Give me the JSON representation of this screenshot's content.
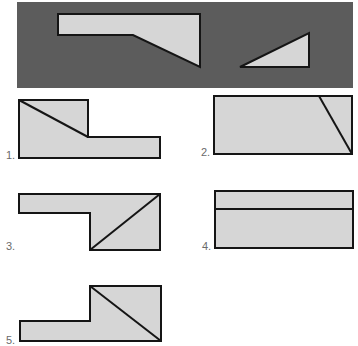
{
  "colors": {
    "panel": "#5c5c5c",
    "fill": "#d6d6d6",
    "stroke": "#151515",
    "label": "#6a6a6a"
  },
  "question": {
    "pieces": [
      {
        "name": "pentagon-piece",
        "points": "58,14 200,14 200,67 133,35 58,35"
      },
      {
        "name": "triangle-piece",
        "points": "240,67 309,33 309,67"
      }
    ]
  },
  "options": [
    {
      "label": "1.",
      "outline": "19,100 88,100 88,137 160,137 160,158 19,158",
      "cut": [
        19,
        100,
        88,
        137
      ]
    },
    {
      "label": "2.",
      "outline": "214,96 352,96 352,154 214,154",
      "cut": [
        319,
        96,
        352,
        154
      ]
    },
    {
      "label": "3.",
      "outline": "19,194 160,194 160,250 90,250 90,213 19,213",
      "cut": [
        90,
        250,
        160,
        194
      ]
    },
    {
      "label": "4.",
      "outline": "215,191 353,191 353,248 215,248",
      "cut": [
        215,
        209,
        353,
        209
      ]
    },
    {
      "label": "5.",
      "outline": "90,286 161,286 161,341 20,341 20,321 90,321",
      "cut": [
        90,
        286,
        161,
        341
      ]
    }
  ]
}
